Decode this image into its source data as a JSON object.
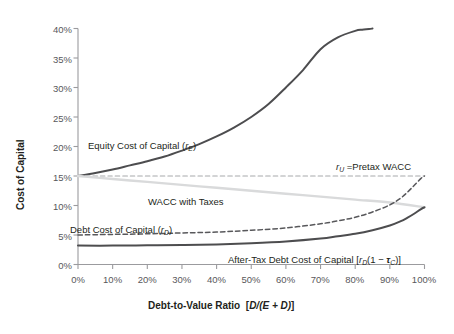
{
  "chart_data": {
    "type": "line",
    "title": "",
    "xlabel": "Debt-to-Value Ratio  [D/(E + D)]",
    "ylabel": "Cost of Capital",
    "xlim": [
      0,
      100
    ],
    "ylim": [
      0,
      40
    ],
    "grid": false,
    "legend": "inline-annotations",
    "x_tick_labels": [
      "0%",
      "10%",
      "20%",
      "30%",
      "40%",
      "50%",
      "60%",
      "70%",
      "80%",
      "90%",
      "100%"
    ],
    "x_tick_values": [
      0,
      10,
      20,
      30,
      40,
      50,
      60,
      70,
      80,
      90,
      100
    ],
    "y_tick_labels": [
      "0%",
      "5%",
      "10%",
      "15%",
      "20%",
      "25%",
      "30%",
      "35%",
      "40%"
    ],
    "y_tick_values": [
      0,
      5,
      10,
      15,
      20,
      25,
      30,
      35,
      40
    ],
    "series": [
      {
        "name": "Equity Cost of Capital (rE)",
        "color": "#4d4d4f",
        "style": "solid",
        "width": 2.0,
        "x": [
          0,
          5,
          10,
          15,
          20,
          25,
          30,
          35,
          40,
          45,
          50,
          55,
          60,
          65,
          70,
          75,
          80,
          82,
          84,
          85
        ],
        "y": [
          15.0,
          15.5,
          16.1,
          16.8,
          17.5,
          18.3,
          19.3,
          20.4,
          21.7,
          23.2,
          25.0,
          27.2,
          30.0,
          33.0,
          36.5,
          38.5,
          39.6,
          39.8,
          39.9,
          40.0
        ]
      },
      {
        "name": "rU = Pretax WACC",
        "color": "#a7a9ac",
        "style": "dashed",
        "width": 1.1,
        "x": [
          0,
          100
        ],
        "y": [
          15.0,
          15.0
        ]
      },
      {
        "name": "WACC with Taxes",
        "color": "#d9dadb",
        "style": "solid",
        "width": 2.4,
        "x": [
          0,
          10,
          20,
          30,
          40,
          50,
          60,
          70,
          80,
          90,
          100
        ],
        "y": [
          15.0,
          14.5,
          14.0,
          13.5,
          13.0,
          12.5,
          12.0,
          11.5,
          11.0,
          10.5,
          9.7
        ]
      },
      {
        "name": "Debt Cost of Capital (rD)",
        "color": "#58585b",
        "style": "dashed",
        "width": 1.5,
        "x": [
          0,
          10,
          20,
          30,
          40,
          50,
          60,
          70,
          75,
          80,
          85,
          90,
          93,
          95,
          97,
          99,
          100
        ],
        "y": [
          5.0,
          5.1,
          5.2,
          5.35,
          5.5,
          5.8,
          6.2,
          6.9,
          7.4,
          8.0,
          8.9,
          10.1,
          11.2,
          12.2,
          13.4,
          14.6,
          15.0
        ]
      },
      {
        "name": "After-Tax Debt Cost of Capital [rD(1 - tauC)]",
        "color": "#4d4d4f",
        "style": "solid",
        "width": 2.0,
        "x": [
          0,
          10,
          20,
          30,
          40,
          50,
          60,
          70,
          75,
          80,
          85,
          90,
          93,
          95,
          97,
          99,
          100
        ],
        "y": [
          3.2,
          3.2,
          3.25,
          3.3,
          3.4,
          3.6,
          3.9,
          4.4,
          4.8,
          5.2,
          5.8,
          6.6,
          7.3,
          7.9,
          8.6,
          9.4,
          9.7
        ]
      }
    ],
    "annotations": [
      {
        "id": "equity-label",
        "text": "Equity Cost of Capital (rE)",
        "x": 7,
        "y": 20.8
      },
      {
        "id": "pretax-wacc-label",
        "text": "rU = Pretax WACC",
        "x": 78,
        "y": 16.4
      },
      {
        "id": "wacc-taxes-label",
        "text": "WACC with Taxes",
        "x": 25,
        "y": 11.9
      },
      {
        "id": "debt-label",
        "text": "Debt Cost of Capital (rD)",
        "x": 3,
        "y": 6.6
      },
      {
        "id": "aftertax-label",
        "text": "After-Tax Debt Cost of Capital [rD(1 - tauC)]",
        "x": 47,
        "y": 2.0
      }
    ]
  },
  "axes": {
    "y_title": "Cost of Capital",
    "x_title_main": "Debt-to-Value Ratio",
    "x_title_formula_open": "[",
    "x_title_formula": "D/(E + D)",
    "x_title_formula_close": "]",
    "y_ticks": [
      "40%",
      "35%",
      "30%",
      "25%",
      "20%",
      "15%",
      "10%",
      "5%",
      "0%"
    ],
    "x_ticks": [
      "0%",
      "10%",
      "20%",
      "30%",
      "40%",
      "50%",
      "60%",
      "70%",
      "80%",
      "90%",
      "100%"
    ]
  },
  "labels": {
    "equity": {
      "text": "Equity Cost of Capital (",
      "sym": "r",
      "sub": "E",
      "tail": ")"
    },
    "pretax": {
      "sym": "r",
      "sub": "U",
      "text": " =Pretax WACC"
    },
    "wacc": {
      "text": "WACC with Taxes"
    },
    "debt": {
      "text": "Debt Cost of Capital (",
      "sym": "r",
      "sub": "D",
      "tail": ")"
    },
    "aftertax": {
      "text": "After-Tax Debt Cost of Capital [",
      "sym": "r",
      "sub": "D",
      "mid": "(1 ",
      "minus": "−",
      "tau": "τ",
      "tausub": "C",
      "tail": ")]"
    }
  },
  "colors": {
    "equity": "#4d4d4f",
    "pretax_wacc": "#a7a9ac",
    "wacc_taxes": "#d9dadb",
    "debt": "#58585b",
    "aftertax_debt": "#4d4d4f",
    "axis": "#9b9b9e",
    "text": "#231f20",
    "tick_text": "#58585b",
    "background": "#ffffff"
  }
}
